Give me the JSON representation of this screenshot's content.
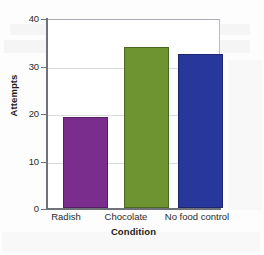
{
  "chart_data": {
    "type": "bar",
    "title": "",
    "subtitle": "",
    "xlabel": "Condition",
    "ylabel": "Attempts",
    "categories": [
      "Radish",
      "Chocolate",
      "No food control"
    ],
    "values": [
      19.3,
      34.3,
      32.8
    ],
    "series": [
      {
        "name": "Attempts",
        "values": [
          19.3,
          34.3,
          32.8
        ]
      }
    ],
    "bar_colors": [
      "#7B2D8E",
      "#6E9431",
      "#27379B"
    ],
    "ylim": [
      0,
      40
    ],
    "yticks": [
      0,
      10,
      20,
      30,
      40
    ],
    "ytick_labels": [
      "0",
      "10",
      "20",
      "30",
      "40"
    ],
    "xticks": [
      "Radish",
      "Chocolate",
      "No food control"
    ],
    "grid": true,
    "grid_axis": "y",
    "legend": false,
    "legend_position": "none",
    "axis_color": "#6f7278",
    "gridline_color": "#d9dbe0",
    "plot_background": "#ffffff",
    "figure_background": "#fdfdfd"
  },
  "bars": [
    {
      "label": "Radish",
      "value": 19.3,
      "color": "#7B2D8E"
    },
    {
      "label": "Chocolate",
      "value": 34.3,
      "color": "#6E9431"
    },
    {
      "label": "No food control",
      "value": 32.8,
      "color": "#27379B"
    }
  ],
  "yticks": [
    {
      "label": "40",
      "value": 40
    },
    {
      "label": "30",
      "value": 30
    },
    {
      "label": "20",
      "value": 20
    },
    {
      "label": "10",
      "value": 10
    },
    {
      "label": "0",
      "value": 0
    }
  ]
}
